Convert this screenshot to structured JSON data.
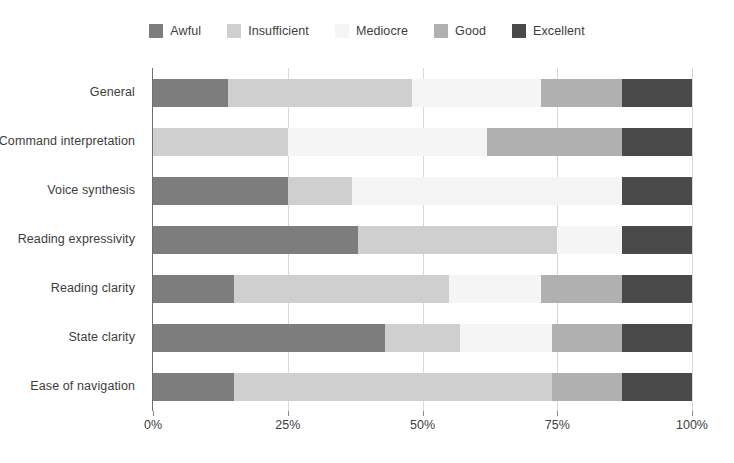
{
  "chart_data": {
    "type": "bar",
    "subtype": "stacked-horizontal-100-percent",
    "title": "",
    "subtitle": "",
    "xlabel": "",
    "ylabel": "",
    "xlim": [
      0,
      100
    ],
    "xtick_labels": [
      "0%",
      "25%",
      "50%",
      "75%",
      "100%"
    ],
    "xtick_values": [
      0,
      25,
      50,
      75,
      100
    ],
    "grid": true,
    "grid_axis": "x",
    "legend_position": "top-center",
    "orientation": "horizontal",
    "categories": [
      "General",
      "Command interpretation",
      "Voice synthesis",
      "Reading expressivity",
      "Reading clarity",
      "State clarity",
      "Ease of navigation"
    ],
    "series": [
      {
        "name": "Awful",
        "color": "#7d7d7d",
        "values": [
          14,
          0,
          25,
          38,
          15,
          43,
          15
        ]
      },
      {
        "name": "Insufficient",
        "color": "#cfcfcf",
        "values": [
          34,
          25,
          12,
          37,
          40,
          14,
          59
        ]
      },
      {
        "name": "Mediocre",
        "color": "#f5f5f5",
        "values": [
          24,
          37,
          50,
          12,
          17,
          17,
          0
        ]
      },
      {
        "name": "Good",
        "color": "#b0b0b0",
        "values": [
          15,
          25,
          0,
          0,
          15,
          13,
          13
        ]
      },
      {
        "name": "Excellent",
        "color": "#4a4a4a",
        "values": [
          13,
          13,
          13,
          13,
          13,
          13,
          13
        ]
      }
    ]
  },
  "legend": {
    "items": [
      {
        "label": "Awful",
        "color": "#7d7d7d"
      },
      {
        "label": "Insufficient",
        "color": "#cfcfcf"
      },
      {
        "label": "Mediocre",
        "color": "#f5f5f5"
      },
      {
        "label": "Good",
        "color": "#b0b0b0"
      },
      {
        "label": "Excellent",
        "color": "#4a4a4a"
      }
    ]
  },
  "axis": {
    "x_ticks": [
      "0%",
      "25%",
      "50%",
      "75%",
      "100%"
    ],
    "y_categories": [
      "General",
      "Command interpretation",
      "Voice synthesis",
      "Reading expressivity",
      "Reading clarity",
      "State clarity",
      "Ease of navigation"
    ]
  }
}
